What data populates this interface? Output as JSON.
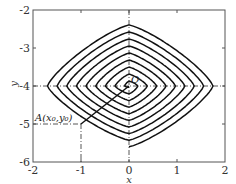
{
  "chart_data": {
    "type": "line",
    "title": "",
    "xlabel": "x",
    "ylabel": "y",
    "xlim": [
      -2,
      2
    ],
    "ylim": [
      -6,
      -2
    ],
    "x_ticks": [
      "-2",
      "-1",
      "0",
      "1",
      "2"
    ],
    "y_ticks": [
      "-2",
      "-3",
      "-4",
      "-5",
      "-6"
    ],
    "grid": false,
    "legend": null,
    "series": [
      {
        "name": "phase trajectory (spiral)",
        "description": "Rounded-diamond spiral winding inward from point A toward the origin O",
        "start": [
          -1,
          -5
        ],
        "end": [
          0,
          -4
        ],
        "outer_extent": {
          "x_min": -1.85,
          "x_max": 1.8,
          "y_min": -5.6,
          "y_max": -2.3
        },
        "turns": 9
      }
    ],
    "annotations": [
      {
        "text": "O",
        "x": 0,
        "y": -4
      },
      {
        "text": "A(x₀,y₀)",
        "x": -1,
        "y": -5
      }
    ],
    "reference_lines": [
      {
        "type": "dash-dot",
        "from": [
          -2,
          -4
        ],
        "to": [
          2,
          -4
        ]
      },
      {
        "type": "dash-dot",
        "from": [
          0,
          -6
        ],
        "to": [
          0,
          -2
        ]
      },
      {
        "type": "dash-dot",
        "from": [
          -2,
          -5
        ],
        "to": [
          -1,
          -5
        ]
      },
      {
        "type": "dash-dot",
        "from": [
          -1,
          -6
        ],
        "to": [
          -1,
          -5
        ]
      }
    ]
  },
  "labels": {
    "x_axis": "x",
    "y_axis": "y",
    "origin": "O",
    "point_a": "A(x₀,y₀)",
    "xticks": [
      "-2",
      "-1",
      "0",
      "1",
      "2"
    ],
    "yticks": [
      "-2",
      "-3",
      "-4",
      "-5",
      "-6"
    ]
  }
}
